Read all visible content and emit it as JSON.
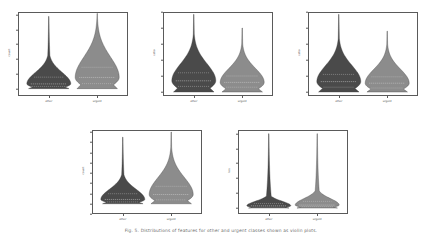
{
  "figure": {
    "caption": "Fig. 5.  Distributions of features for other and urgent classes shown as violin plots.",
    "categories": [
      "other",
      "urgent"
    ],
    "colors": {
      "other_fill": "#4a4a4a",
      "urgent_fill": "#8c8c8c",
      "edge": "#3a3a3a",
      "axis": "#5a5a5a",
      "quartile_line": "#d8d8d8",
      "background": "#ffffff"
    }
  },
  "chart_data": [
    {
      "type": "violin",
      "panel_id": "panel-1",
      "title": "",
      "xlabel": "",
      "ylabel": "count",
      "categories": [
        "other",
        "urgent"
      ],
      "ylim": [
        -500,
        5200
      ],
      "yticks": [
        0,
        1000,
        2000,
        3000,
        4000,
        5000
      ],
      "ytick_labels": [
        "0",
        "1000",
        "2000",
        "3000",
        "4000",
        "5000"
      ],
      "grid": false,
      "legend": "none",
      "series": [
        {
          "name": "other",
          "median": 320,
          "q1": 150,
          "q3": 780,
          "min": 0,
          "max": 4900,
          "mean": 640,
          "skew": "right"
        },
        {
          "name": "urgent",
          "median": 760,
          "q1": 340,
          "q3": 1450,
          "min": 0,
          "max": 5100,
          "mean": 1150,
          "skew": "right"
        }
      ]
    },
    {
      "type": "violin",
      "panel_id": "panel-2",
      "title": "",
      "xlabel": "",
      "ylabel": "ratio",
      "categories": [
        "other",
        "urgent"
      ],
      "ylim": [
        -0.05,
        1.0
      ],
      "yticks": [
        0.0,
        0.2,
        0.4,
        0.6,
        0.8,
        1.0
      ],
      "ytick_labels": [
        "0.0",
        "0.2",
        "0.4",
        "0.6",
        "0.8",
        "1.0"
      ],
      "grid": false,
      "legend": "none",
      "series": [
        {
          "name": "other",
          "median": 0.14,
          "q1": 0.07,
          "q3": 0.24,
          "min": 0.0,
          "max": 0.97,
          "mean": 0.19,
          "skew": "right"
        },
        {
          "name": "urgent",
          "median": 0.12,
          "q1": 0.06,
          "q3": 0.2,
          "min": 0.0,
          "max": 0.8,
          "mean": 0.16,
          "skew": "right"
        }
      ]
    },
    {
      "type": "violin",
      "panel_id": "panel-3",
      "title": "",
      "xlabel": "",
      "ylabel": "ratio",
      "categories": [
        "other",
        "urgent"
      ],
      "ylim": [
        -0.05,
        1.0
      ],
      "yticks": [
        0.0,
        0.2,
        0.4,
        0.6,
        0.8,
        1.0
      ],
      "ytick_labels": [
        "0.0",
        "0.2",
        "0.4",
        "0.6",
        "0.8",
        "1.0"
      ],
      "grid": false,
      "legend": "none",
      "series": [
        {
          "name": "other",
          "median": 0.13,
          "q1": 0.06,
          "q3": 0.22,
          "min": 0.0,
          "max": 0.97,
          "mean": 0.18,
          "skew": "right"
        },
        {
          "name": "urgent",
          "median": 0.11,
          "q1": 0.05,
          "q3": 0.19,
          "min": 0.0,
          "max": 0.76,
          "mean": 0.15,
          "skew": "right"
        }
      ]
    },
    {
      "type": "violin",
      "panel_id": "panel-4",
      "title": "",
      "xlabel": "",
      "ylabel": "count",
      "categories": [
        "other",
        "urgent"
      ],
      "ylim": [
        -1000,
        7200
      ],
      "yticks": [
        -1000,
        0,
        1000,
        2000,
        3000,
        4000,
        5000,
        6000,
        7000
      ],
      "ytick_labels": [
        "-1000",
        "0",
        "1000",
        "2000",
        "3000",
        "4000",
        "5000",
        "6000",
        "7000"
      ],
      "grid": false,
      "legend": "none",
      "series": [
        {
          "name": "other",
          "median": 420,
          "q1": 180,
          "q3": 980,
          "min": 0,
          "max": 6500,
          "mean": 820,
          "skew": "right"
        },
        {
          "name": "urgent",
          "median": 900,
          "q1": 380,
          "q3": 1700,
          "min": 0,
          "max": 7000,
          "mean": 1350,
          "skew": "right"
        }
      ]
    },
    {
      "type": "violin",
      "panel_id": "panel-5",
      "title": "",
      "xlabel": "",
      "ylabel": "len",
      "categories": [
        "other",
        "urgent"
      ],
      "ylim": [
        -8,
        105
      ],
      "yticks": [
        0,
        20,
        40,
        60,
        80,
        100
      ],
      "ytick_labels": [
        "0",
        "20",
        "40",
        "60",
        "80",
        "100"
      ],
      "grid": false,
      "legend": "none",
      "series": [
        {
          "name": "other",
          "median": 3,
          "q1": 1,
          "q3": 6,
          "min": 0,
          "max": 100,
          "mean": 5,
          "skew": "right"
        },
        {
          "name": "urgent",
          "median": 4,
          "q1": 2,
          "q3": 9,
          "min": 0,
          "max": 100,
          "mean": 7,
          "skew": "right"
        }
      ]
    }
  ]
}
